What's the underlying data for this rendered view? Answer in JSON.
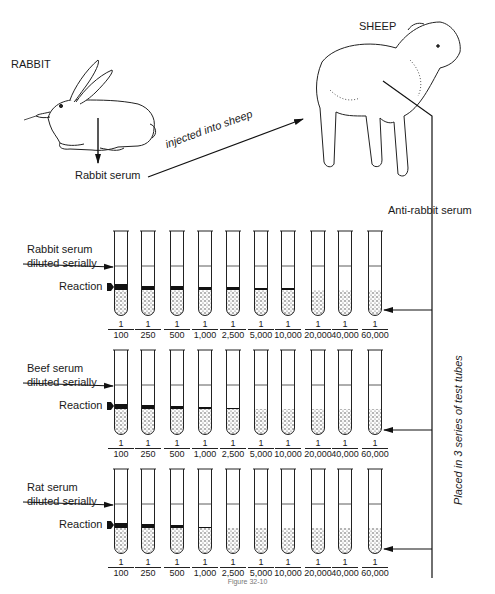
{
  "top": {
    "rabbit_label": "RABBIT",
    "sheep_label": "SHEEP",
    "rabbit_serum_label": "Rabbit serum",
    "injection_label": "injected into sheep",
    "anti_serum_label": "Anti-rabbit serum",
    "side_label": "Placed in 3 series of test tubes"
  },
  "dilutions": [
    {
      "num": "1",
      "den": "100"
    },
    {
      "num": "1",
      "den": "250"
    },
    {
      "num": "1",
      "den": "500"
    },
    {
      "num": "1",
      "den": "1,000"
    },
    {
      "num": "1",
      "den": "2,500"
    },
    {
      "num": "1",
      "den": "5,000"
    },
    {
      "num": "1",
      "den": "10,000"
    },
    {
      "num": "1",
      "den": "20,000"
    },
    {
      "num": "1",
      "den": "40,000"
    },
    {
      "num": "1",
      "den": "60,000"
    }
  ],
  "rows": [
    {
      "serum_label_line1": "Rabbit serum",
      "serum_label_line2": "diluted serially",
      "reaction_label": "Reaction",
      "reaction_band_px": [
        6,
        4,
        4,
        3,
        3,
        2,
        2,
        0,
        0,
        0
      ]
    },
    {
      "serum_label_line1": "Beef serum",
      "serum_label_line2": "diluted serially",
      "reaction_label": "Reaction",
      "reaction_band_px": [
        5,
        4,
        3,
        2,
        1,
        0,
        0,
        0,
        0,
        0
      ]
    },
    {
      "serum_label_line1": "Rat serum",
      "serum_label_line2": "diluted serially",
      "reaction_label": "Reaction",
      "reaction_band_px": [
        5,
        4,
        3,
        1,
        0,
        0,
        0,
        0,
        0,
        0
      ]
    }
  ],
  "caption": "Figure 32-10"
}
